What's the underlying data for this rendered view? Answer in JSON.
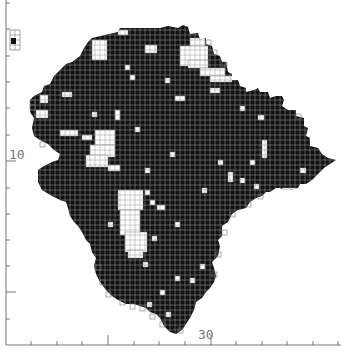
{
  "figure": {
    "type": "grid-square distribution map",
    "axis_labels": {
      "y_major": "10",
      "x_major": "30"
    },
    "colors": {
      "recorded": "#111111",
      "unrecorded": "#ffffff",
      "grid": "#8a8a8a",
      "axis": "#555555"
    },
    "x_ticks_px": [
      31,
      57,
      82,
      108,
      134,
      159,
      185,
      211,
      236,
      262,
      287,
      313,
      338
    ],
    "x_major_ticks_px": [
      108,
      211
    ],
    "y_ticks_px": [
      3,
      29,
      56,
      82,
      108,
      135,
      161,
      188,
      214,
      240,
      266,
      292,
      319
    ],
    "y_major_ticks_px": [
      161,
      292
    ]
  }
}
